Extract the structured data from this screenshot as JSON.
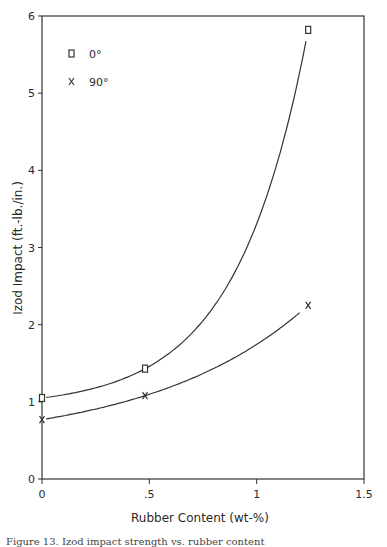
{
  "chart_data": {
    "type": "line",
    "title": "",
    "xlabel": "Rubber Content (wt-%)",
    "ylabel": "Izod Impact (ft.-lb./in.)",
    "xlim": [
      0,
      1.5
    ],
    "ylim": [
      0,
      6
    ],
    "x_ticks": [
      0,
      0.5,
      1,
      1.5
    ],
    "x_tick_labels": [
      "0",
      ".5",
      "1",
      "1.5"
    ],
    "y_ticks": [
      0,
      1,
      2,
      3,
      4,
      5,
      6
    ],
    "y_tick_labels": [
      "0",
      "1",
      "2",
      "3",
      "4",
      "5",
      "6"
    ],
    "grid": false,
    "legend_position": "upper left",
    "series": [
      {
        "name": "0°",
        "marker": "square",
        "x": [
          0,
          0.48,
          1.24
        ],
        "values": [
          1.05,
          1.43,
          5.82
        ]
      },
      {
        "name": "90°",
        "marker": "x",
        "x": [
          0,
          0.48,
          1.24
        ],
        "values": [
          0.77,
          1.08,
          2.25
        ]
      }
    ]
  },
  "legend": {
    "items": [
      {
        "label": "0°",
        "marker": "square-icon"
      },
      {
        "label": "90°",
        "marker": "x-icon"
      }
    ]
  },
  "caption": "Figure 13. Izod impact strength vs. rubber content"
}
